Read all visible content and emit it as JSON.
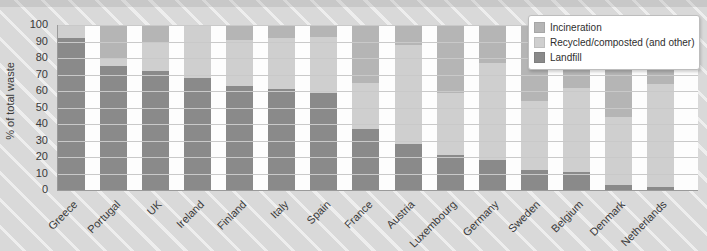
{
  "chart_data": {
    "type": "bar",
    "stacked": true,
    "title": "",
    "ylabel": "% of total waste",
    "xlabel": "",
    "ylim": [
      0,
      100
    ],
    "yticks": [
      0,
      10,
      20,
      30,
      40,
      50,
      60,
      70,
      80,
      90,
      100
    ],
    "grid": true,
    "legend_position": "top-right",
    "categories": [
      "Greece",
      "Portugal",
      "UK",
      "Ireland",
      "Finland",
      "Italy",
      "Spain",
      "France",
      "Austria",
      "Luxembourg",
      "Germany",
      "Sweden",
      "Belgium",
      "Denmark",
      "Netherlands"
    ],
    "series": [
      {
        "name": "Landfill",
        "color": "#8a8a8a",
        "values": [
          92,
          75,
          72,
          68,
          63,
          61,
          59,
          37,
          28,
          21,
          18,
          12,
          11,
          3,
          2
        ]
      },
      {
        "name": "Recycled/composted (and other)",
        "color": "#cfcfcf",
        "values": [
          8,
          5,
          17,
          32,
          28,
          31,
          34,
          28,
          60,
          38,
          59,
          42,
          51,
          41,
          62
        ]
      },
      {
        "name": "Incineration",
        "color": "#b5b5b5",
        "values": [
          0,
          20,
          11,
          0,
          9,
          8,
          7,
          35,
          12,
          41,
          23,
          46,
          38,
          56,
          36
        ]
      }
    ]
  },
  "legend": {
    "items": [
      {
        "label": "Incineration",
        "color": "#b5b5b5"
      },
      {
        "label": "Recycled/composted (and other)",
        "color": "#cfcfcf"
      },
      {
        "label": "Landfill",
        "color": "#8a8a8a"
      }
    ]
  },
  "colors": {
    "background": "#d9d9d9",
    "plot_background": "#fdfdfd",
    "gridline": "#c9c9c9",
    "axis_text": "#3a3a3a"
  }
}
